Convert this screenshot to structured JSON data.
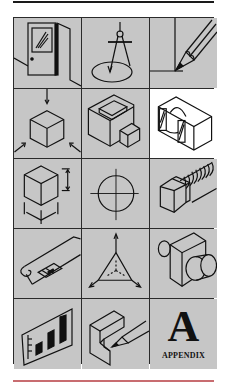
{
  "colors": {
    "cell_background": "#c6c6c6",
    "selected_background": "#ffffff",
    "line": "#111111",
    "top_rule": "#1a1a1a",
    "bottom_rule": "#c86c70"
  },
  "grid": {
    "rows": 5,
    "columns": 3,
    "cells": [
      {
        "icon": "door-sketch-icon",
        "selected": false
      },
      {
        "icon": "compass-icon",
        "selected": false
      },
      {
        "icon": "pencil-corner-icon",
        "selected": false
      },
      {
        "icon": "cube-projection-icon",
        "selected": false
      },
      {
        "icon": "hollow-block-icon",
        "selected": false
      },
      {
        "icon": "section-view-icon",
        "selected": true
      },
      {
        "icon": "dimensioned-cube-icon",
        "selected": false
      },
      {
        "icon": "centerline-circle-icon",
        "selected": false
      },
      {
        "icon": "hex-bolt-icon",
        "selected": false
      },
      {
        "icon": "blueprint-scroll-icon",
        "selected": false
      },
      {
        "icon": "axes-triangle-icon",
        "selected": false
      },
      {
        "icon": "cylinder-block-icon",
        "selected": false
      },
      {
        "icon": "bar-chart-icon",
        "selected": false
      },
      {
        "icon": "pencil-block-icon",
        "selected": false
      },
      {
        "icon": "appendix-icon",
        "selected": false
      }
    ]
  },
  "appendix": {
    "letter": "A",
    "label": "APPENDIX"
  }
}
